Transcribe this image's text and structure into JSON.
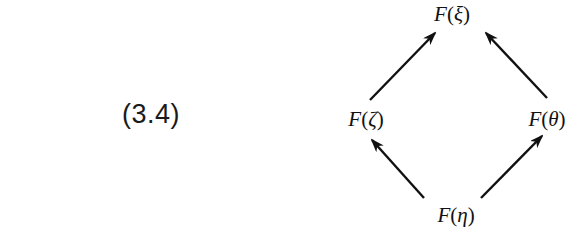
{
  "equation": {
    "number": "(3.4)"
  },
  "diagram": {
    "type": "commutative-diamond",
    "nodes": {
      "top": {
        "fn": "F",
        "open": "(",
        "arg": "ξ",
        "close": ")"
      },
      "left": {
        "fn": "F",
        "open": "(",
        "arg": "ζ",
        "close": ")"
      },
      "right": {
        "fn": "F",
        "open": "(",
        "arg": "θ",
        "close": ")"
      },
      "bottom": {
        "fn": "F",
        "open": "(",
        "arg": "η",
        "close": ")"
      }
    },
    "edges": [
      {
        "from": "bottom",
        "to": "left"
      },
      {
        "from": "bottom",
        "to": "right"
      },
      {
        "from": "left",
        "to": "top"
      },
      {
        "from": "right",
        "to": "top"
      }
    ],
    "color": "#111111"
  }
}
